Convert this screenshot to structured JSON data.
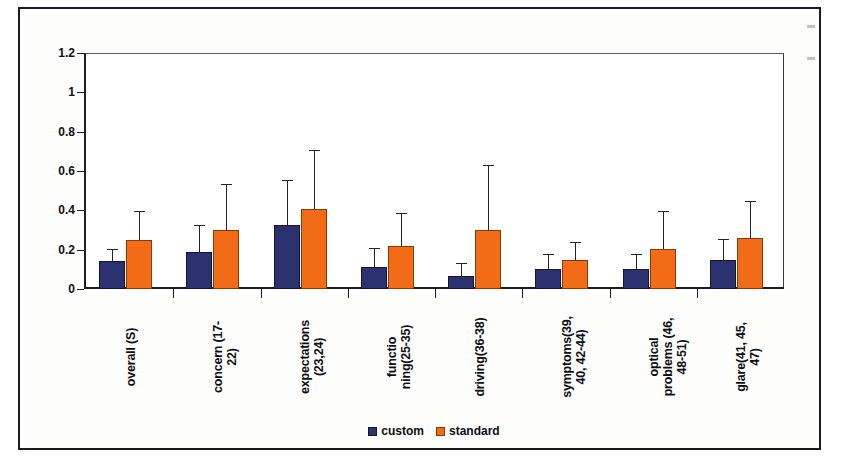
{
  "figure": {
    "frame_border_color": "#1b1b22",
    "background": "#ffffff"
  },
  "chart_data": {
    "type": "bar",
    "title": "",
    "subtitle": "",
    "xlabel": "",
    "ylabel": "",
    "ylim": [
      0,
      1.2
    ],
    "yticks": [
      0,
      0.2,
      0.4,
      0.6,
      0.8,
      1,
      1.2
    ],
    "ytick_labels": [
      "0",
      "0.2",
      "0.4",
      "0.6",
      "0.8",
      "1",
      "1.2"
    ],
    "grid": false,
    "legend_position": "bottom",
    "error_bars": "upper-only",
    "categories": [
      "overall (S)",
      "concern (17-\n22)",
      "expectations\n(23,24)",
      "functio\nning(25-35)",
      "driving(36-38)",
      "symptoms(39,\n40, 42-44)",
      "optical\nproblems (46,\n48-51)",
      "glare(41, 45,\n47)"
    ],
    "series": [
      {
        "name": "custom",
        "color": "#2c3270",
        "values": [
          0.14,
          0.19,
          0.325,
          0.11,
          0.065,
          0.1,
          0.1,
          0.145
        ],
        "errors_upper": [
          0.2,
          0.32,
          0.55,
          0.205,
          0.125,
          0.175,
          0.175,
          0.25
        ]
      },
      {
        "name": "standard",
        "color": "#f26c18",
        "values": [
          0.25,
          0.3,
          0.405,
          0.22,
          0.3,
          0.15,
          0.205,
          0.26
        ],
        "errors_upper": [
          0.39,
          0.53,
          0.7,
          0.38,
          0.625,
          0.235,
          0.39,
          0.44
        ]
      }
    ],
    "legend": [
      {
        "label": "custom",
        "color": "#2c3270"
      },
      {
        "label": "standard",
        "color": "#f26c18"
      }
    ]
  }
}
